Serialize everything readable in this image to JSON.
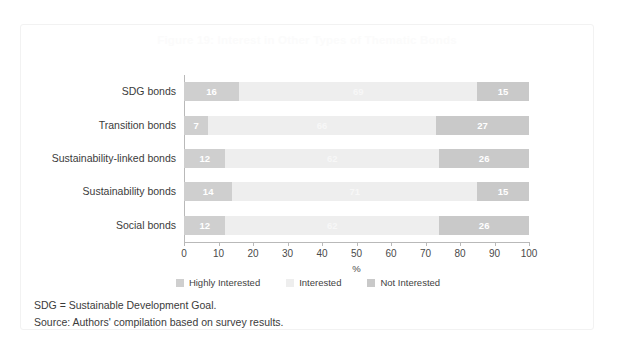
{
  "figure": {
    "title": "Figure 19: Interest in Other Types of Thematic Bonds",
    "notes": [
      "SDG = Sustainable Development Goal.",
      "Source: Authors' compilation based on survey results."
    ]
  },
  "colors": {
    "highly_interested": "#cfcfcf",
    "interested": "#eeeeee",
    "not_interested": "#c9c9c9",
    "axis": "#b9b9b9",
    "text": "#3b3b3b",
    "title": "#fbfbfb"
  },
  "chart_data": {
    "type": "bar",
    "orientation": "horizontal",
    "stacked": true,
    "title": "Figure 19: Interest in Other Types of Thematic Bonds",
    "xlabel": "%",
    "ylabel": "",
    "xlim": [
      0,
      100
    ],
    "xticks": [
      0,
      10,
      20,
      30,
      40,
      50,
      60,
      70,
      80,
      90,
      100
    ],
    "grid": false,
    "legend_position": "bottom",
    "categories": [
      "SDG bonds",
      "Transition bonds",
      "Sustainability-linked bonds",
      "Sustainability bonds",
      "Social bonds"
    ],
    "series": [
      {
        "name": "Highly Interested",
        "values": [
          16,
          7,
          12,
          14,
          12
        ]
      },
      {
        "name": "Interested",
        "values": [
          69,
          66,
          62,
          71,
          62
        ]
      },
      {
        "name": "Not Interested",
        "values": [
          15,
          27,
          26,
          15,
          26
        ]
      }
    ]
  }
}
